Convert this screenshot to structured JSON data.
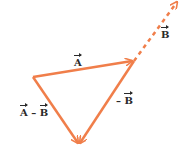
{
  "diagram": {
    "type": "vector-subtraction-triangle",
    "color": "#f07e4a",
    "labels": {
      "A": "A",
      "B": "B",
      "neg_prefix": "–",
      "minus": " – "
    },
    "vertices": {
      "left": [
        33,
        77
      ],
      "right": [
        134,
        61
      ],
      "bottom": [
        79,
        145
      ],
      "dashed_end": [
        178,
        1
      ]
    }
  }
}
